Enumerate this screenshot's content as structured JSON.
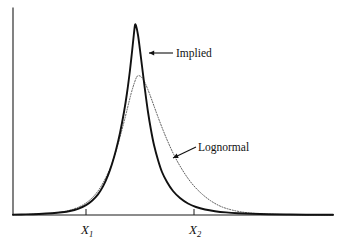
{
  "figure": {
    "background_color": "#ffffff",
    "curve_color": "#111111",
    "dotted_curve_color": "#4a4a4a",
    "axis_color": "#1a1a1a"
  },
  "annotations": [
    {
      "id": "implied",
      "label": "Implied",
      "text_x": 176,
      "text_y": 57,
      "arrow_type": "horizontal-left",
      "arrow_x1": 173,
      "arrow_y1": 53,
      "arrow_x2": 149,
      "arrow_y2": 53
    },
    {
      "id": "lognormal",
      "label": "Lognormal",
      "text_x": 198,
      "text_y": 151,
      "arrow_type": "diagonal-down-left",
      "arrow_x1": 196,
      "arrow_y1": 147,
      "arrow_x2": 173,
      "arrow_y2": 158
    }
  ],
  "x_axis_labels": [
    {
      "id": "x1",
      "base": "X",
      "subscript": "1",
      "tick_x": 86,
      "label_x": 81,
      "label_y": 234
    },
    {
      "id": "x2",
      "base": "X",
      "subscript": "2",
      "tick_x": 194,
      "label_x": 189,
      "label_y": 234
    }
  ],
  "chart_data": {
    "type": "line",
    "title": "",
    "xlabel": "",
    "ylabel": "",
    "grid": false,
    "legend_position": "inline-annotations",
    "axis": {
      "x_start_px": 13,
      "x_end_px": 333,
      "y_baseline_px": 215,
      "y_top_px": 8
    },
    "xticks": [
      "X1",
      "X2"
    ],
    "xtick_positions_px": [
      86,
      194
    ],
    "series": [
      {
        "name": "Implied",
        "style": "solid",
        "description": "Implied risk-neutral density: tall narrow peak with fat right tail",
        "peak_x_px": 135,
        "peak_y_px": 25,
        "peak_height_rel": 1.0,
        "points_px": [
          [
            13,
            214.6
          ],
          [
            26,
            214.4
          ],
          [
            39,
            214.0
          ],
          [
            52,
            213.3
          ],
          [
            62,
            212.3
          ],
          [
            70,
            211.0
          ],
          [
            78,
            208.8
          ],
          [
            86,
            205.2
          ],
          [
            92,
            200.8
          ],
          [
            98,
            194.4
          ],
          [
            103,
            186.4
          ],
          [
            108,
            175.4
          ],
          [
            112,
            164.0
          ],
          [
            116,
            150.0
          ],
          [
            120,
            133.0
          ],
          [
            124,
            112.0
          ],
          [
            127,
            93.0
          ],
          [
            130,
            70.0
          ],
          [
            132,
            52.0
          ],
          [
            134,
            33.0
          ],
          [
            135,
            25.0
          ],
          [
            136,
            25.6
          ],
          [
            138,
            35.0
          ],
          [
            140,
            50.0
          ],
          [
            142,
            66.0
          ],
          [
            145,
            90.0
          ],
          [
            148,
            112.0
          ],
          [
            151,
            130.0
          ],
          [
            154,
            145.0
          ],
          [
            158,
            160.0
          ],
          [
            162,
            172.0
          ],
          [
            167,
            182.0
          ],
          [
            173,
            191.0
          ],
          [
            180,
            198.0
          ],
          [
            188,
            203.5
          ],
          [
            196,
            207.0
          ],
          [
            205,
            209.5
          ],
          [
            215,
            211.2
          ],
          [
            226,
            212.4
          ],
          [
            238,
            213.2
          ],
          [
            252,
            213.8
          ],
          [
            268,
            214.2
          ],
          [
            286,
            214.5
          ],
          [
            306,
            214.7
          ],
          [
            333,
            214.8
          ]
        ]
      },
      {
        "name": "Lognormal",
        "style": "dotted",
        "description": "Lognormal density: lower broader peak, thinner right tail",
        "peak_x_px": 137,
        "peak_y_px": 76,
        "peak_height_rel": 0.73,
        "points_px": [
          [
            13,
            214.7
          ],
          [
            28,
            214.4
          ],
          [
            42,
            213.9
          ],
          [
            54,
            213.0
          ],
          [
            64,
            211.6
          ],
          [
            72,
            209.6
          ],
          [
            80,
            206.4
          ],
          [
            86,
            203.0
          ],
          [
            92,
            198.0
          ],
          [
            98,
            191.0
          ],
          [
            103,
            183.0
          ],
          [
            108,
            173.0
          ],
          [
            112,
            163.0
          ],
          [
            116,
            151.0
          ],
          [
            120,
            137.0
          ],
          [
            124,
            122.0
          ],
          [
            128,
            106.0
          ],
          [
            131,
            94.0
          ],
          [
            134,
            84.0
          ],
          [
            137,
            76.5
          ],
          [
            140,
            76.0
          ],
          [
            143,
            79.0
          ],
          [
            146,
            85.0
          ],
          [
            150,
            95.0
          ],
          [
            154,
            106.0
          ],
          [
            158,
            117.0
          ],
          [
            163,
            130.0
          ],
          [
            168,
            142.0
          ],
          [
            174,
            155.0
          ],
          [
            180,
            166.0
          ],
          [
            187,
            177.0
          ],
          [
            194,
            186.0
          ],
          [
            202,
            194.0
          ],
          [
            211,
            201.0
          ],
          [
            221,
            206.5
          ],
          [
            232,
            210.0
          ],
          [
            244,
            212.3
          ],
          [
            257,
            213.6
          ],
          [
            272,
            214.3
          ],
          [
            290,
            214.6
          ],
          [
            310,
            214.8
          ],
          [
            333,
            214.9
          ]
        ]
      }
    ]
  }
}
